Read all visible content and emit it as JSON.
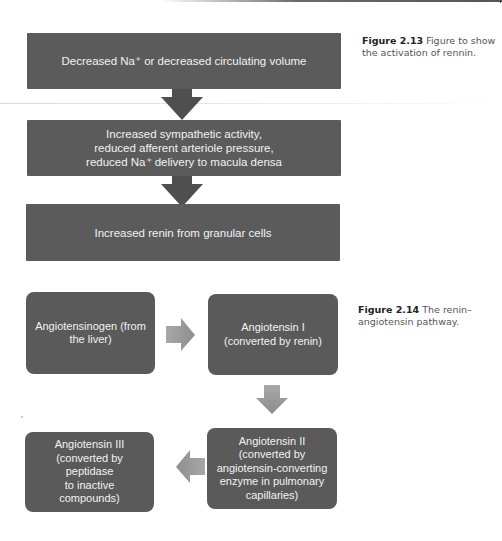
{
  "figure_213": {
    "caption_label": "Figure 2.13",
    "caption_text": " Figure to show the activation of rennin.",
    "steps": [
      {
        "lines": [
          "Decreased Na⁺ or decreased circulating volume"
        ]
      },
      {
        "lines": [
          "Increased sympathetic activity,",
          "reduced afferent arteriole pressure,",
          "reduced Na⁺ delivery to macula densa"
        ]
      },
      {
        "lines": [
          "Increased renin from granular cells"
        ]
      }
    ],
    "arrow_color": "#4f4f4f",
    "box_color": "#5b5b5b"
  },
  "figure_214": {
    "caption_label": "Figure 2.14",
    "caption_text": " The renin–angiotensin pathway.",
    "nodes": [
      {
        "id": "angiotensinogen",
        "lines": [
          "Angiotensinogen (from",
          "the liver)"
        ]
      },
      {
        "id": "angiotensin-i",
        "lines": [
          "Angiotensin I",
          "(converted by renin)"
        ]
      },
      {
        "id": "angiotensin-ii",
        "lines": [
          "Angiotensin II",
          "(converted by",
          "angiotensin-converting",
          "enzyme in pulmonary",
          "capillaries)"
        ]
      },
      {
        "id": "angiotensin-iii",
        "lines": [
          "Angiotensin III",
          "(converted by peptidase",
          "to inactive compounds)"
        ]
      }
    ],
    "arrows": [
      "right",
      "down",
      "left"
    ],
    "arrow_color": "#9a9a9a",
    "box_color": "#5a5a5a"
  }
}
